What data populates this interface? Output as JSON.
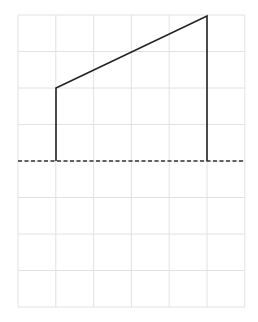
{
  "diagram": {
    "type": "grid-shape",
    "grid": {
      "x0": 18,
      "y0": 15,
      "columns": 6,
      "rows": 8,
      "cell_w": 37.8,
      "cell_h": 36.5,
      "color": "#e2e2e2"
    },
    "shape": {
      "points": [
        [
          56,
          161
        ],
        [
          56,
          88
        ],
        [
          207,
          16
        ],
        [
          207,
          161
        ]
      ],
      "stroke": "#222222",
      "stroke_width": 1.6
    },
    "baseline": {
      "y": 161,
      "x1": 18,
      "x2": 245,
      "stroke": "#333333",
      "dash": "4,2.5"
    }
  }
}
